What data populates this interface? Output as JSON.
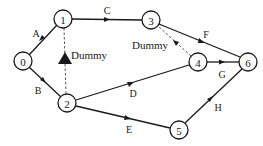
{
  "diagram": {
    "type": "activity-network",
    "nodes": [
      {
        "id": "0",
        "label": "0",
        "x": 23,
        "y": 61
      },
      {
        "id": "1",
        "label": "1",
        "x": 63,
        "y": 19
      },
      {
        "id": "2",
        "label": "2",
        "x": 67,
        "y": 103
      },
      {
        "id": "3",
        "label": "3",
        "x": 151,
        "y": 20
      },
      {
        "id": "4",
        "label": "4",
        "x": 198,
        "y": 62
      },
      {
        "id": "5",
        "label": "5",
        "x": 179,
        "y": 130
      },
      {
        "id": "6",
        "label": "6",
        "x": 248,
        "y": 62
      }
    ],
    "edges": [
      {
        "from": "0",
        "to": "1",
        "label": "A",
        "dashed": false
      },
      {
        "from": "0",
        "to": "2",
        "label": "B",
        "dashed": false
      },
      {
        "from": "1",
        "to": "3",
        "label": "C",
        "dashed": false
      },
      {
        "from": "2",
        "to": "4",
        "label": "D",
        "dashed": false
      },
      {
        "from": "2",
        "to": "5",
        "label": "E",
        "dashed": false
      },
      {
        "from": "3",
        "to": "6",
        "label": "F",
        "dashed": false
      },
      {
        "from": "4",
        "to": "6",
        "label": "G",
        "dashed": false
      },
      {
        "from": "5",
        "to": "6",
        "label": "H",
        "dashed": false
      },
      {
        "from": "2",
        "to": "1",
        "label": "Dummy",
        "dashed": true
      },
      {
        "from": "4",
        "to": "3",
        "label": "Dummy",
        "dashed": true
      }
    ]
  },
  "labels": {
    "A": "A",
    "B": "B",
    "C": "C",
    "D": "D",
    "E": "E",
    "F": "F",
    "G": "G",
    "H": "H",
    "dummy_left": "Dummy",
    "dummy_right": "Dummy"
  },
  "node_labels": {
    "n0": "0",
    "n1": "1",
    "n2": "2",
    "n3": "3",
    "n4": "4",
    "n5": "5",
    "n6": "6"
  }
}
